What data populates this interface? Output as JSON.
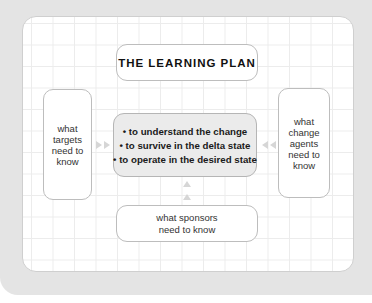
{
  "diagram": {
    "title": "THE LEARNING PLAN",
    "left_box": [
      "what",
      "targets",
      "need to",
      "know"
    ],
    "right_box": [
      "what",
      "change",
      "agents",
      "need to",
      "know"
    ],
    "center_items": [
      "• to understand the change",
      "• to survive in the delta state",
      "• to operate in the desired state"
    ],
    "bottom_box": [
      "what sponsors",
      "need to know"
    ],
    "arrows": {
      "left_to_center": "arrow-right-icon",
      "right_to_center": "arrow-left-icon",
      "bottom_to_center": "arrow-up-icon"
    },
    "colors": {
      "outer_panel": "#e4e4e4",
      "inner_panel": "#ffffff",
      "grid": "#ececec",
      "center_fill": "#ebebeb",
      "arrow": "#d6d6d6"
    }
  }
}
